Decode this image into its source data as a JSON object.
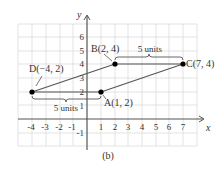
{
  "figure": {
    "caption": "(b)",
    "axes": {
      "x_label": "x",
      "y_label": "y",
      "x_ticks": [
        "-4",
        "-3",
        "-2",
        "-1",
        "1",
        "2",
        "3",
        "4",
        "5",
        "6",
        "7"
      ],
      "y_ticks": [
        "-1",
        "1",
        "2",
        "3",
        "4",
        "5",
        "6"
      ]
    },
    "points": [
      {
        "name": "A",
        "label": "A(1, 2)",
        "x": 1,
        "y": 2
      },
      {
        "name": "B",
        "label": "B(2, 4)",
        "x": 2,
        "y": 4
      },
      {
        "name": "C",
        "label": "C(7, 4)",
        "x": 7,
        "y": 4
      },
      {
        "name": "D",
        "label": "D(−4, 2)",
        "x": -4,
        "y": 2
      }
    ],
    "annotations": {
      "top_brace": "5 units",
      "bottom_brace": "5 units"
    },
    "colors": {
      "grid": "#d9d9d9",
      "axis": "#555555",
      "line": "#555555",
      "point": "#000000",
      "text": "#333333"
    }
  }
}
